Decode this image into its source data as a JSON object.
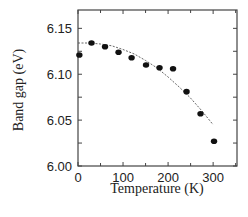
{
  "chart_data": {
    "type": "scatter",
    "title": "",
    "xlabel": "Temperature (K)",
    "ylabel": "Band gap (eV)",
    "xlim": [
      0,
      353
    ],
    "ylim": [
      6.0,
      6.17
    ],
    "x_ticks": [
      0,
      100,
      200,
      300
    ],
    "x_tick_labels": [
      "0",
      "100",
      "200",
      "300"
    ],
    "y_ticks": [
      6.0,
      6.05,
      6.1,
      6.15
    ],
    "y_tick_labels": [
      "6.00",
      "6.05",
      "6.10",
      "6.15"
    ],
    "grid": false,
    "legend": null,
    "series": [
      {
        "name": "measured",
        "style": "markers",
        "color": "#111111",
        "x": [
          3,
          30,
          60,
          90,
          119,
          151,
          181,
          211,
          241,
          272,
          302
        ],
        "y": [
          6.121,
          6.134,
          6.13,
          6.124,
          6.118,
          6.11,
          6.107,
          6.106,
          6.081,
          6.057,
          6.027
        ]
      },
      {
        "name": "fit",
        "style": "dashed-line",
        "color": "#555555",
        "x": [
          0,
          25,
          50,
          75,
          100,
          125,
          150,
          175,
          200,
          225,
          250,
          275,
          300
        ],
        "y": [
          6.134,
          6.134,
          6.133,
          6.131,
          6.127,
          6.122,
          6.115,
          6.107,
          6.097,
          6.086,
          6.074,
          6.06,
          6.045
        ]
      }
    ]
  }
}
